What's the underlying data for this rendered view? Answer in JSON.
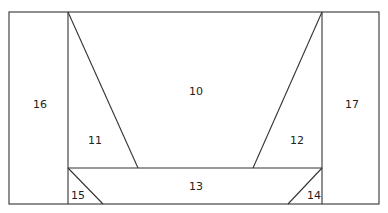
{
  "diagram": {
    "regions": [
      {
        "id": "10",
        "label": "10",
        "x": 196,
        "y": 95
      },
      {
        "id": "11",
        "label": "11",
        "x": 95,
        "y": 144
      },
      {
        "id": "12",
        "label": "12",
        "x": 297,
        "y": 144
      },
      {
        "id": "13",
        "label": "13",
        "x": 196,
        "y": 190
      },
      {
        "id": "14",
        "label": "14",
        "x": 314,
        "y": 199
      },
      {
        "id": "15",
        "label": "15",
        "x": 78,
        "y": 199
      },
      {
        "id": "16",
        "label": "16",
        "x": 40,
        "y": 108
      },
      {
        "id": "17",
        "label": "17",
        "x": 352,
        "y": 108
      }
    ],
    "line_color": "#333333",
    "background": "#ffffff"
  }
}
